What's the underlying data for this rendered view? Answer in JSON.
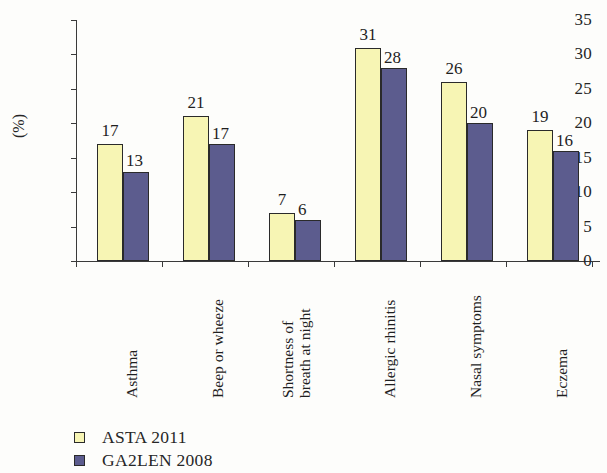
{
  "chart_data": {
    "type": "bar",
    "title": "",
    "subtitle": "",
    "xlabel": "",
    "ylabel": "(%)",
    "ylim": [
      0,
      35
    ],
    "ytick_step": 5,
    "yticks": [
      35,
      30,
      25,
      20,
      15,
      10,
      5,
      0
    ],
    "grid": false,
    "legend_position": "bottom-left",
    "categories": [
      "Asthma",
      "Beep or wheeze",
      "Shortness of breath at night",
      "Allergic rhinitis",
      "Nasal symptoms",
      "Eczema"
    ],
    "category_lines": [
      [
        "Asthma"
      ],
      [
        "Beep or wheeze"
      ],
      [
        "Shortness of",
        "breath at night"
      ],
      [
        "Allergic rhinitis"
      ],
      [
        "Nasal symptoms"
      ],
      [
        "Eczema"
      ]
    ],
    "series": [
      {
        "name": "ASTA 2011",
        "color": "#f7f5b4",
        "values": [
          17,
          21,
          7,
          31,
          26,
          19
        ]
      },
      {
        "name": "GA2LEN 2008",
        "color": "#5c5c8e",
        "values": [
          13,
          17,
          6,
          28,
          20,
          16
        ]
      }
    ],
    "data_labels": true,
    "annotations": []
  },
  "legend": {
    "items": [
      {
        "label": "ASTA 2011",
        "swatch": "legend-swatch-asta"
      },
      {
        "label": "GA2LEN 2008",
        "swatch": "legend-swatch-ga2len"
      }
    ]
  }
}
